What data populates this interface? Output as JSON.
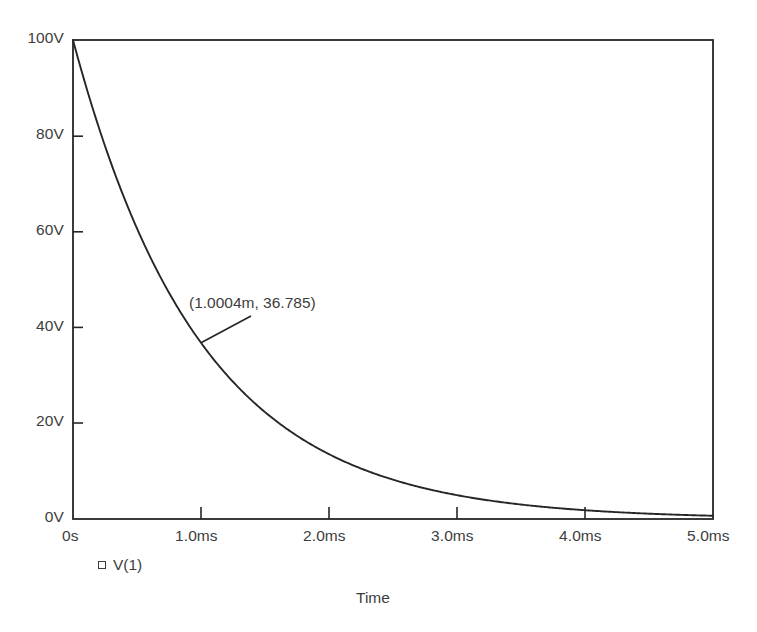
{
  "chart_data": {
    "type": "line",
    "title": "",
    "subtitle": "",
    "xlabel": "Time",
    "ylabel": "",
    "xlim": [
      0,
      5
    ],
    "ylim": [
      0,
      100
    ],
    "x_unit": "ms",
    "y_unit": "V",
    "grid": false,
    "legend_position": "bottom-left",
    "x_tick_labels": [
      "0s",
      "1.0ms",
      "2.0ms",
      "3.0ms",
      "4.0ms",
      "5.0ms"
    ],
    "x_tick_values": [
      0,
      1,
      2,
      3,
      4,
      5
    ],
    "y_tick_labels": [
      "0V",
      "20V",
      "40V",
      "60V",
      "80V",
      "100V"
    ],
    "y_tick_values": [
      0,
      20,
      40,
      60,
      80,
      100
    ],
    "series": [
      {
        "name": "V(1)",
        "marker": "open-square",
        "color": "#262626",
        "description": "Exponential decay V = 100 * exp(-t / 1ms)",
        "x": [
          0,
          0.1,
          0.2,
          0.3,
          0.4,
          0.5,
          0.6,
          0.7,
          0.8,
          0.9,
          1.0,
          1.2,
          1.4,
          1.6,
          1.8,
          2.0,
          2.25,
          2.5,
          2.75,
          3.0,
          3.25,
          3.5,
          3.75,
          4.0,
          4.25,
          4.5,
          4.75,
          5.0
        ],
        "values": [
          100.0,
          90.48,
          81.87,
          74.08,
          67.03,
          60.65,
          54.88,
          49.66,
          44.93,
          40.66,
          36.79,
          30.12,
          24.66,
          20.19,
          16.53,
          13.53,
          10.54,
          8.21,
          6.39,
          4.98,
          3.88,
          3.02,
          2.35,
          1.83,
          1.43,
          1.11,
          0.87,
          0.67
        ]
      }
    ],
    "annotations": [
      {
        "label": "(1.0004m, 36.785)",
        "point_x": 1.0004,
        "point_y": 36.785
      }
    ]
  },
  "legend": {
    "items": [
      {
        "label": "V(1)",
        "marker": "open-square"
      }
    ]
  },
  "axes": {
    "x_title": "Time"
  }
}
